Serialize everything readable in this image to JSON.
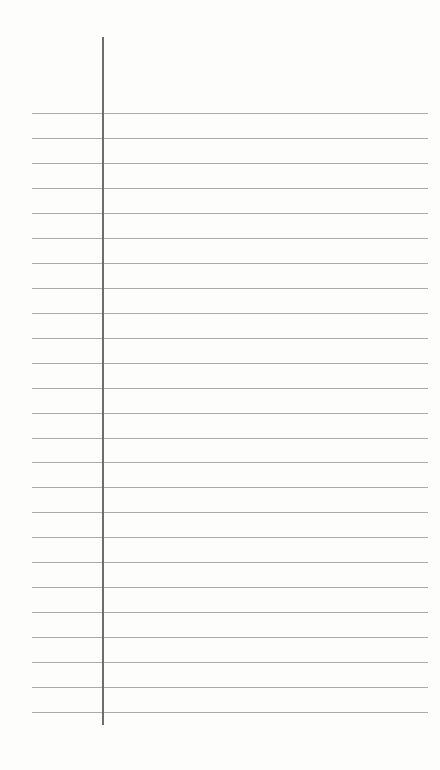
{
  "paper": {
    "type": "lined-notepaper",
    "background": "#fdfdfc",
    "rule_color": "#a9aaaa",
    "margin_color": "#6e6e70",
    "rule_count": 25,
    "first_rule_y": 113,
    "rule_spacing": 24.96,
    "rule_x_start": 32,
    "rule_x_end": 428,
    "margin_x": 102,
    "margin_top": 37,
    "margin_bottom": 725
  }
}
